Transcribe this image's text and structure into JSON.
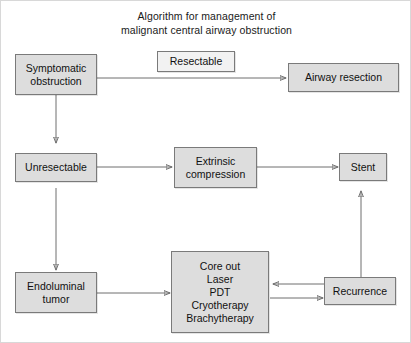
{
  "figure": {
    "title_line1": "Algorithm for management of",
    "title_line2": "malignant central airway obstruction",
    "border_color": "#d8d8d8",
    "node_fill": "#dddddd",
    "node_plain_fill": "#f2f2f2",
    "node_border": "#7a7a7a",
    "edge_color": "#6f6f6f"
  },
  "nodes": {
    "symptomatic_obstruction": {
      "line1": "Symptomatic",
      "line2": "obstruction"
    },
    "resectable_label": {
      "label": "Resectable"
    },
    "airway_resection": {
      "label": "Airway resection"
    },
    "unresectable": {
      "label": "Unresectable"
    },
    "extrinsic_compression": {
      "line1": "Extrinsic",
      "line2": "compression"
    },
    "stent": {
      "label": "Stent"
    },
    "endoluminal_tumor": {
      "line1": "Endoluminal",
      "line2": "tumor"
    },
    "treatments": {
      "item1": "Core out",
      "item2": "Laser",
      "item3": "PDT",
      "item4": "Cryotherapy",
      "item5": "Brachytherapy"
    },
    "recurrence": {
      "label": "Recurrence"
    }
  },
  "edges": {
    "e1": "symptomatic-obstruction-to-airway-resection",
    "e2": "symptomatic-obstruction-to-unresectable",
    "e3": "unresectable-to-extrinsic-compression",
    "e4": "extrinsic-compression-to-stent",
    "e5": "unresectable-to-endoluminal-tumor",
    "e6": "endoluminal-tumor-to-treatments",
    "e7": "treatments-to-recurrence",
    "e8": "recurrence-to-treatments",
    "e9": "recurrence-to-stent"
  }
}
